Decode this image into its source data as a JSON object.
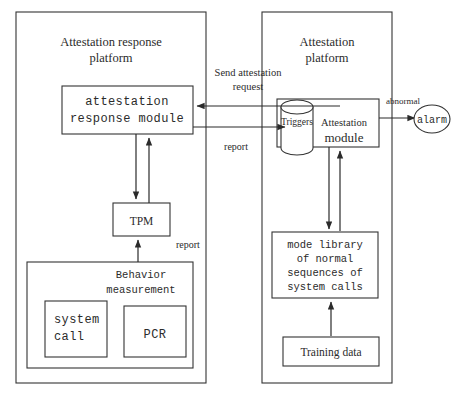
{
  "diagram": {
    "left_platform": {
      "title_line1": "Attestation response",
      "title_line2": "platform",
      "response_module": {
        "line1": "attestation",
        "line2": "response module"
      },
      "tpm": "TPM",
      "tpm_report_label": "report",
      "behavior": {
        "title_line1": "Behavior",
        "title_line2": "measurement",
        "system_call_line1": "system",
        "system_call_line2": "call",
        "pcr": "PCR"
      }
    },
    "right_platform": {
      "title_line1": "Attestation",
      "title_line2": "platform",
      "triggers": "Triggers",
      "attestation_module_line1": "Attestation",
      "attestation_module_line2": "module",
      "mode_library": {
        "line1": "mode library",
        "line2": "of normal",
        "line3": "sequences  of",
        "line4": "system calls"
      },
      "training_data": "Training data"
    },
    "alarm": "alarm",
    "edge_labels": {
      "send_request_line1": "Send attestation",
      "send_request_line2": "request",
      "report": "report",
      "abnormal": "abnormal"
    },
    "colors": {
      "stroke": "#333333",
      "text": "#2b2b2b",
      "background": "#ffffff"
    }
  }
}
